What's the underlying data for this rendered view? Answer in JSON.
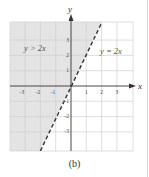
{
  "figure": {
    "caption": "(b)",
    "x_axis_label": "x",
    "y_axis_label": "y",
    "x_ticks": [
      "-3",
      "-2",
      "-1",
      "1",
      "2",
      "3"
    ],
    "y_ticks": [
      "3",
      "2",
      "1",
      "-1",
      "-2",
      "-3"
    ],
    "region_label": "y > 2x",
    "line_label": "y = 2x",
    "shade_color": "#e6e6e6",
    "grid_color": "#cfcfcf",
    "line_color": "#333333"
  }
}
